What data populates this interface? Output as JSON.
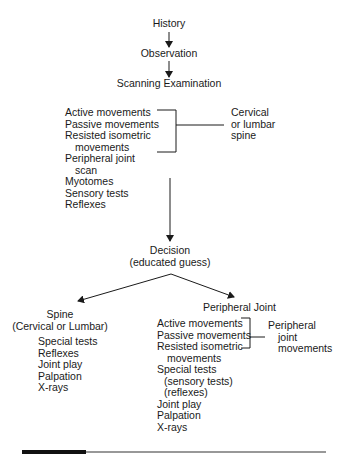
{
  "flow": {
    "history": "History",
    "observation": "Observation",
    "scanning": "Scanning Examination",
    "scan_items": [
      "Active movements",
      "Passive movements",
      "Resisted isometric",
      "movements",
      "Peripheral joint",
      "scan",
      "Myotomes",
      "Sensory tests",
      "Reflexes"
    ],
    "scan_bracket_label": [
      "Cervical",
      "or lumbar",
      "spine"
    ],
    "decision": [
      "Decision",
      "(educated  guess)"
    ]
  },
  "spine_branch": {
    "title": [
      "Spine",
      "(Cervical or Lumbar)"
    ],
    "items": [
      "Special tests",
      "Reflexes",
      "Joint play",
      "Palpation",
      "X-rays"
    ]
  },
  "peripheral_branch": {
    "title": "Peripheral Joint",
    "items": [
      "Active movements",
      "Passive movements",
      "Resisted isometric",
      "movements",
      "Special tests",
      "(sensory tests)",
      "(reflexes)",
      "Joint play",
      "Palpation",
      "X-rays"
    ],
    "bracket_label": [
      "Peripheral",
      "joint",
      "movements"
    ]
  },
  "colors": {
    "line": "#1a1a1a",
    "background": "#ffffff"
  }
}
